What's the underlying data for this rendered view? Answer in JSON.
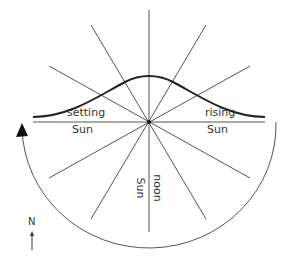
{
  "diagram": {
    "title": "",
    "labels": {
      "setting": "setting",
      "setting_sun": "Sun",
      "rising": "rising",
      "rising_sun": "Sun",
      "noon": "noon",
      "noon_sun": "Sun",
      "north": "N"
    },
    "colors": {
      "line": "#555555",
      "curve": "#222222",
      "text": "#333333",
      "background": "#ffffff"
    },
    "center": [
      149,
      122
    ],
    "rays_count": 12,
    "elements": [
      "horizon line",
      "12 radial direction lines",
      "sun path curve (bell shape)",
      "semicircular arc with arrowhead",
      "north arrow"
    ]
  }
}
